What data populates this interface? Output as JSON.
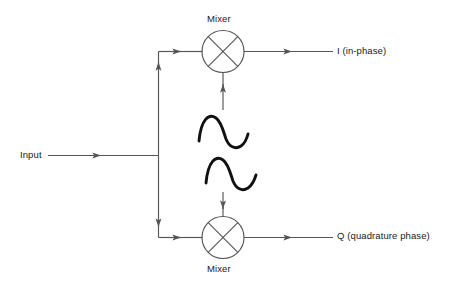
{
  "diagram": {
    "title_present": false,
    "kind": "iq-demodulator-block-diagram",
    "colors": {
      "background": "#ffffff",
      "line": "#555555",
      "wave": "#111111",
      "text": "#1a1a1a"
    },
    "labels": {
      "input": "Input",
      "mixer_top": "Mixer",
      "mixer_bottom": "Mixer",
      "output_i": "I (in-phase)",
      "output_q": "Q (quadrature phase)"
    },
    "nodes": [
      {
        "name": "input-source",
        "label": "Input",
        "x": 20,
        "y": 155
      },
      {
        "name": "splitter-junction",
        "label": "",
        "x": 158,
        "y": 155
      },
      {
        "name": "mixer-top",
        "label": "Mixer",
        "cx": 223,
        "cy": 51,
        "r": 21
      },
      {
        "name": "mixer-bottom",
        "label": "Mixer",
        "cx": 223,
        "cy": 237,
        "r": 21
      },
      {
        "name": "lo-wave-upper",
        "label": "",
        "x": 199,
        "y": 130
      },
      {
        "name": "lo-wave-lower",
        "label": "",
        "x": 206,
        "y": 172
      },
      {
        "name": "output-i",
        "label": "I (in-phase)",
        "x": 337,
        "y": 51
      },
      {
        "name": "output-q",
        "label": "Q (quadrature phase)",
        "x": 337,
        "y": 237
      }
    ],
    "edges": [
      {
        "from": "input-source",
        "to": "splitter-junction",
        "arrow": "right"
      },
      {
        "from": "splitter-junction",
        "to": "mixer-top",
        "arrow": "up-right"
      },
      {
        "from": "splitter-junction",
        "to": "mixer-bottom",
        "arrow": "down-right"
      },
      {
        "from": "mixer-top",
        "to": "output-i",
        "arrow": "right"
      },
      {
        "from": "mixer-bottom",
        "to": "output-q",
        "arrow": "right"
      },
      {
        "from": "lo-wave-upper",
        "to": "mixer-top",
        "arrow": "up"
      },
      {
        "from": "lo-wave-lower",
        "to": "mixer-bottom",
        "arrow": "down"
      }
    ]
  }
}
